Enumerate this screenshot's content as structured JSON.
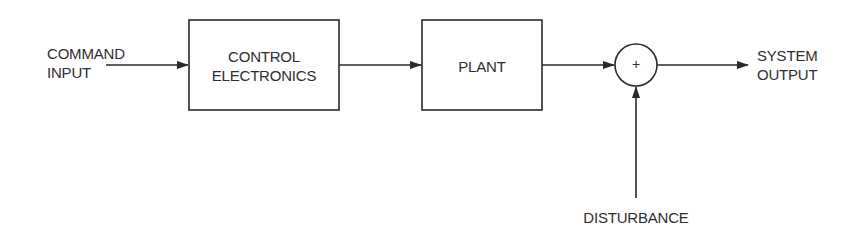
{
  "diagram": {
    "type": "control-system-block-diagram",
    "colors": {
      "stroke": "#2a2a2a",
      "background": "#ffffff",
      "text": "#2e2e2e"
    },
    "inputs": {
      "command_input": {
        "line1": "COMMAND",
        "line2": "INPUT"
      },
      "disturbance": {
        "label": "DISTURBANCE"
      }
    },
    "blocks": [
      {
        "id": "control",
        "line1": "CONTROL",
        "line2": "ELECTRONICS"
      },
      {
        "id": "plant",
        "line1": "PLANT"
      }
    ],
    "summing_junction": {
      "symbol": "+"
    },
    "outputs": {
      "system_output": {
        "line1": "SYSTEM",
        "line2": "OUTPUT"
      }
    },
    "connections": [
      {
        "from": "COMMAND INPUT",
        "to": "CONTROL ELECTRONICS"
      },
      {
        "from": "CONTROL ELECTRONICS",
        "to": "PLANT"
      },
      {
        "from": "PLANT",
        "to": "+"
      },
      {
        "from": "DISTURBANCE",
        "to": "+"
      },
      {
        "from": "+",
        "to": "SYSTEM OUTPUT"
      }
    ]
  }
}
